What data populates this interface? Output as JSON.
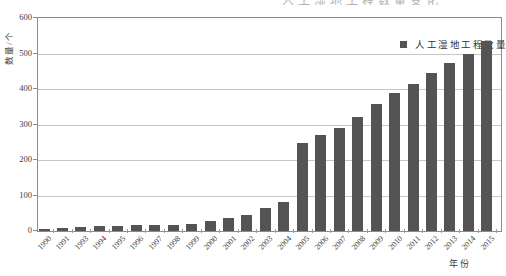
{
  "page": {
    "clipped_text_fragment": "人工湿地工程数量变化"
  },
  "chart_data": {
    "type": "bar",
    "title": "",
    "xlabel": "年份",
    "ylabel": "数量/个",
    "categories": [
      "1990",
      "1991",
      "1993",
      "1994",
      "1995",
      "1996",
      "1997",
      "1998",
      "1999",
      "2000",
      "2001",
      "2002",
      "2003",
      "2004",
      "2005",
      "2006",
      "2007",
      "2008",
      "2009",
      "2010",
      "2011",
      "2012",
      "2013",
      "2014",
      "2015"
    ],
    "values": [
      5,
      9,
      11,
      13,
      14,
      16,
      17,
      18,
      20,
      27,
      36,
      45,
      64,
      81,
      248,
      270,
      290,
      320,
      358,
      390,
      415,
      445,
      472,
      500,
      535
    ],
    "ylim": [
      0,
      600
    ],
    "yticks": [
      0,
      100,
      200,
      300,
      400,
      500,
      600
    ],
    "grid": true,
    "legend": {
      "label": "人工湿地工程数量",
      "position": "top-right-inside"
    },
    "colors": {
      "bar": "#545454",
      "gridline": "#c6c6c6",
      "axis": "#8c8c8c",
      "text": "#3c3c3c"
    }
  }
}
